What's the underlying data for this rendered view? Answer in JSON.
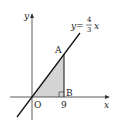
{
  "diagram": {
    "type": "coordinate-graph",
    "axes": {
      "x_label": "x",
      "y_label": "y",
      "origin_label": "O"
    },
    "line": {
      "equation_prefix": "y=",
      "numerator": "4",
      "denominator": "3",
      "variable": "x"
    },
    "points": {
      "A": {
        "label": "A"
      },
      "B": {
        "label": "B"
      }
    },
    "tick": {
      "label": "9"
    },
    "colors": {
      "shade": "#d4d4d4",
      "stroke": "#222222"
    }
  }
}
